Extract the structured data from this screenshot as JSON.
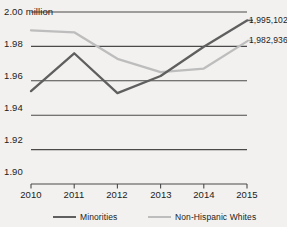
{
  "chart_data": {
    "type": "line",
    "title": "",
    "xlabel": "",
    "ylabel": "",
    "unit_note": "2.00 million",
    "x": [
      "2010",
      "2011",
      "2012",
      "2013",
      "2014",
      "2015"
    ],
    "xlim": [
      2010,
      2015
    ],
    "ylim": [
      1.9,
      2.0
    ],
    "yticks": [
      "1.90",
      "1.92",
      "1.94",
      "1.96",
      "1.98",
      "2.00 million"
    ],
    "ytick_values": [
      1.9,
      1.92,
      1.94,
      1.96,
      1.98,
      2.0
    ],
    "grid": true,
    "legend_position": "bottom",
    "series": [
      {
        "name": "Minorities",
        "color": "#5f5f5f",
        "values": [
          1.954,
          1.976,
          1.9528,
          1.9628,
          1.9798,
          1.995102
        ],
        "end_label": "1,995,102"
      },
      {
        "name": "Non-Hispanic Whites",
        "color": "#bdbdbd",
        "values": [
          1.9893,
          1.9882,
          1.9728,
          1.9651,
          1.9671,
          1.982936
        ],
        "end_label": "1,982,936"
      }
    ]
  },
  "axis": {
    "y_labels": [
      {
        "text": "2.00 million",
        "value": 2.0
      },
      {
        "text": "1.98",
        "value": 1.98
      },
      {
        "text": "1.96",
        "value": 1.96
      },
      {
        "text": "1.94",
        "value": 1.94
      },
      {
        "text": "1.92",
        "value": 1.92
      },
      {
        "text": "1.90",
        "value": 1.9
      }
    ],
    "x_labels": [
      "2010",
      "2011",
      "2012",
      "2013",
      "2014",
      "2015"
    ]
  },
  "legend": {
    "items": [
      {
        "label": "Minorities",
        "color": "#5f5f5f"
      },
      {
        "label": "Non-Hispanic Whites",
        "color": "#bdbdbd"
      }
    ]
  },
  "value_labels": {
    "minorities_end": "1,995,102",
    "whites_end": "1,982,936"
  },
  "colors": {
    "background": "#f2f1ef",
    "gridline": "#4a4a4a",
    "text": "#1c1c1c",
    "minorities": "#5f5f5f",
    "whites": "#bdbdbd"
  }
}
